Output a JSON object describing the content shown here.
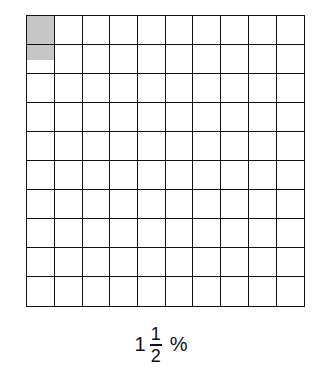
{
  "figure": {
    "grid": {
      "rows": 10,
      "cols": 10,
      "shaded_full": [
        0
      ],
      "shaded_half": [
        10
      ],
      "shade_color": "#c6c6c6",
      "line_color": "#111111"
    },
    "label": {
      "whole": "1",
      "numerator": "1",
      "denominator": "2",
      "percent_sign": "%"
    }
  }
}
